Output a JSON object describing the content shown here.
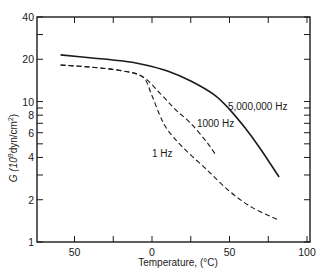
{
  "chart_data": {
    "type": "line",
    "title": "",
    "xlabel": "Temperature, (°C)",
    "ylabel": "G (10^9 dyn/cm^2)",
    "ylabel_parts": {
      "base": "G (10",
      "sup1": "9",
      "mid": "dyn/cm",
      "sup2": "2",
      "end": ")"
    },
    "xlim": [
      -74,
      102
    ],
    "ylim": [
      1,
      40
    ],
    "yscale": "log",
    "grid": false,
    "legend": "inline labels",
    "x_ticks": [
      -50,
      -25,
      0,
      25,
      50,
      75,
      100
    ],
    "x_tick_labels": [
      {
        "value": -50,
        "label": "50"
      },
      {
        "value": 0,
        "label": "0"
      },
      {
        "value": 50,
        "label": "50"
      },
      {
        "value": 100,
        "label": "100"
      }
    ],
    "y_ticks": [
      1,
      2,
      3,
      4,
      5,
      6,
      7,
      8,
      9,
      10,
      20,
      30,
      40
    ],
    "y_tick_labels": [
      {
        "value": 1,
        "label": "1"
      },
      {
        "value": 2,
        "label": "2"
      },
      {
        "value": 4,
        "label": "4"
      },
      {
        "value": 6,
        "label": "6"
      },
      {
        "value": 8,
        "label": "8"
      },
      {
        "value": 10,
        "label": "10"
      },
      {
        "value": 20,
        "label": "20"
      },
      {
        "value": 40,
        "label": "40"
      }
    ],
    "series": [
      {
        "name": "5,000,000 Hz",
        "style": "solid",
        "x": [
          -59,
          -40,
          -20,
          -5,
          10,
          25,
          40,
          50,
          60,
          70,
          82
        ],
        "y": [
          21.5,
          20.5,
          19.5,
          18.3,
          16.5,
          14.0,
          11.2,
          8.8,
          6.5,
          4.6,
          2.9
        ],
        "label_pos": {
          "x": 49,
          "y": 8.7
        }
      },
      {
        "name": "1000 Hz",
        "style": "dashed",
        "x": [
          -59,
          -40,
          -20,
          -6,
          5,
          15,
          25,
          35,
          41
        ],
        "y": [
          18.2,
          17.6,
          16.6,
          15.0,
          11.5,
          8.8,
          7.0,
          5.2,
          4.2
        ],
        "label_pos": {
          "x": 29,
          "y": 6.6
        }
      },
      {
        "name": "1 Hz",
        "style": "dashed",
        "x": [
          -59,
          -40,
          -20,
          -6,
          0,
          5,
          10,
          20,
          35,
          50,
          65,
          82
        ],
        "y": [
          18.2,
          17.6,
          16.6,
          15.0,
          11.0,
          8.0,
          6.3,
          4.7,
          3.3,
          2.3,
          1.75,
          1.43
        ],
        "label_pos": {
          "x": 0,
          "y": 4.0
        }
      }
    ]
  }
}
